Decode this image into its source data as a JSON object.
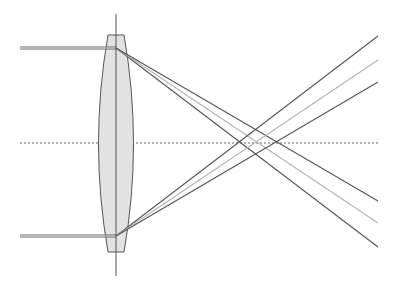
{
  "diagram": {
    "width": 419,
    "height": 286,
    "colors": {
      "background": "#ffffff",
      "lens_fill": "#e2e2e2",
      "lens_stroke": "#555555",
      "axis": "#666666",
      "ray_dark": "#555555",
      "ray_light": "#b4b4b4",
      "incoming": "#666666"
    },
    "optical_axis": {
      "y": 143,
      "x1": 20,
      "x2": 380,
      "style": "dashed"
    },
    "lens": {
      "center_x": 116,
      "vertical_line": {
        "y1": 14,
        "y2": 276
      },
      "top_flat": {
        "y": 35,
        "x1": 108,
        "x2": 124
      },
      "bottom_flat": {
        "y": 252,
        "x1": 108,
        "x2": 124
      },
      "half_width_at_center": 21
    },
    "incoming_rays": [
      {
        "name": "top-beam",
        "y": 48,
        "x1": 20,
        "x2": 112
      },
      {
        "name": "bottom-beam",
        "y": 236,
        "x1": 20,
        "x2": 112
      }
    ],
    "refracted_rays": [
      {
        "name": "top-ray-short-focus",
        "color": "ray_dark",
        "from": [
          116,
          48
        ],
        "to": [
          378,
          247
        ]
      },
      {
        "name": "top-ray-mid-focus",
        "color": "ray_light",
        "from": [
          116,
          48
        ],
        "to": [
          378,
          223
        ]
      },
      {
        "name": "top-ray-long-focus",
        "color": "ray_dark",
        "from": [
          116,
          48
        ],
        "to": [
          378,
          201
        ]
      },
      {
        "name": "bottom-ray-short-focus",
        "color": "ray_dark",
        "from": [
          116,
          236
        ],
        "to": [
          378,
          36
        ]
      },
      {
        "name": "bottom-ray-mid-focus",
        "color": "ray_light",
        "from": [
          116,
          236
        ],
        "to": [
          378,
          60
        ]
      },
      {
        "name": "bottom-ray-long-focus",
        "color": "ray_dark",
        "from": [
          116,
          236
        ],
        "to": [
          378,
          82
        ]
      }
    ]
  }
}
